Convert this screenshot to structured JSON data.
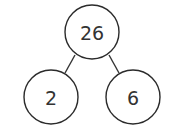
{
  "diagram": {
    "type": "number-bond",
    "colors": {
      "stroke": "#2b2b2b",
      "text": "#333333",
      "background": "#ffffff"
    },
    "whole": {
      "label": "26",
      "cx": 92,
      "cy": 32,
      "r": 27
    },
    "parts": [
      {
        "label": "2",
        "cx": 51,
        "cy": 97,
        "r": 27
      },
      {
        "label": "6",
        "cx": 133,
        "cy": 97,
        "r": 27
      }
    ],
    "edges": [
      {
        "x1": 75,
        "y1": 55,
        "x2": 65,
        "y2": 73
      },
      {
        "x1": 109,
        "y1": 55,
        "x2": 119,
        "y2": 73
      }
    ]
  }
}
